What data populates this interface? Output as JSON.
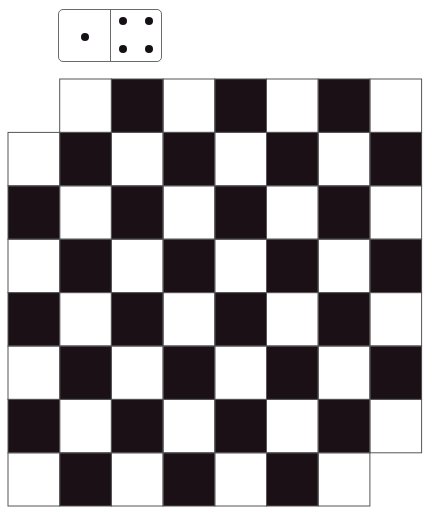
{
  "domino": {
    "left_half": {
      "pips": 1
    },
    "right_half": {
      "pips": 4
    },
    "value": "1-4"
  },
  "board": {
    "colors": {
      "dark": "#1a1016",
      "light": "#ffffff",
      "line": "#555555"
    },
    "grid": {
      "col_edges": [
        8,
        59.7,
        111.4,
        163.1,
        214.8,
        266.5,
        318.2,
        369.9,
        421.6
      ],
      "row_edges": [
        79,
        132.4,
        185.8,
        239.2,
        292.6,
        346,
        399.4,
        452.8,
        506
      ]
    },
    "rows": [
      {
        "row": 0,
        "start_col": 1,
        "end_col": 7
      },
      {
        "row": 1,
        "start_col": 0,
        "end_col": 7
      },
      {
        "row": 2,
        "start_col": 0,
        "end_col": 7
      },
      {
        "row": 3,
        "start_col": 0,
        "end_col": 7
      },
      {
        "row": 4,
        "start_col": 0,
        "end_col": 7
      },
      {
        "row": 5,
        "start_col": 0,
        "end_col": 7
      },
      {
        "row": 6,
        "start_col": 0,
        "end_col": 7
      },
      {
        "row": 7,
        "start_col": 0,
        "end_col": 6
      }
    ],
    "dark_rule": "(row + col) % 2 == 0"
  }
}
